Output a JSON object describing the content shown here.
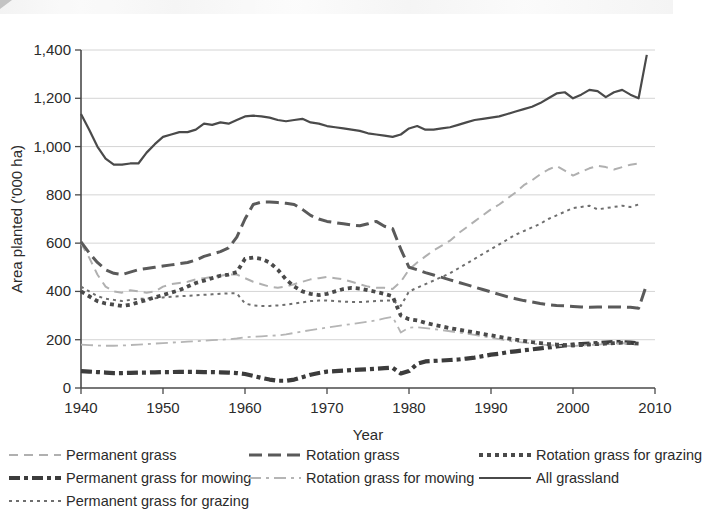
{
  "chart_data": {
    "type": "line",
    "title": "",
    "xlabel": "Year",
    "ylabel": "Area planted ('000 ha)",
    "xlim": [
      1940,
      2010
    ],
    "ylim": [
      0,
      1400
    ],
    "xticks": [
      "1940",
      "1950",
      "1960",
      "1970",
      "1980",
      "1990",
      "2000",
      "2010"
    ],
    "yticks": [
      "0",
      "200",
      "400",
      "600",
      "800",
      "1,000",
      "1,200",
      "1,400"
    ],
    "grid": true,
    "legend_position": "below",
    "series": [
      {
        "name": "Permanent grass",
        "style": "dashed-light",
        "color": "#b0b0b0",
        "x": [
          1940,
          1941,
          1942,
          1943,
          1944,
          1945,
          1946,
          1947,
          1948,
          1949,
          1950,
          1951,
          1952,
          1953,
          1954,
          1955,
          1956,
          1957,
          1958,
          1959,
          1960,
          1961,
          1962,
          1963,
          1964,
          1965,
          1966,
          1967,
          1968,
          1969,
          1970,
          1971,
          1972,
          1973,
          1974,
          1975,
          1976,
          1977,
          1978,
          1979,
          1980,
          1981,
          1982,
          1983,
          1984,
          1985,
          1986,
          1987,
          1988,
          1989,
          1990,
          1991,
          1992,
          1993,
          1994,
          1995,
          1996,
          1997,
          1998,
          1999,
          2000,
          2001,
          2002,
          2003,
          2004,
          2005,
          2006,
          2007,
          2008
        ],
        "y": [
          600,
          540,
          470,
          420,
          400,
          395,
          405,
          400,
          395,
          400,
          420,
          430,
          435,
          440,
          450,
          455,
          460,
          465,
          470,
          470,
          455,
          440,
          430,
          420,
          415,
          420,
          430,
          440,
          450,
          455,
          460,
          455,
          450,
          440,
          430,
          420,
          415,
          415,
          410,
          440,
          490,
          520,
          545,
          570,
          590,
          610,
          640,
          665,
          690,
          715,
          740,
          760,
          785,
          810,
          840,
          860,
          885,
          905,
          920,
          900,
          880,
          895,
          910,
          920,
          915,
          905,
          915,
          925,
          930
        ]
      },
      {
        "name": "Permanent grass for mowing",
        "style": "dashdot-heavy",
        "color": "#3c3c3c",
        "x": [
          1940,
          1941,
          1942,
          1943,
          1944,
          1945,
          1946,
          1947,
          1948,
          1949,
          1950,
          1951,
          1952,
          1953,
          1954,
          1955,
          1956,
          1957,
          1958,
          1959,
          1960,
          1961,
          1962,
          1963,
          1964,
          1965,
          1966,
          1967,
          1968,
          1969,
          1970,
          1971,
          1972,
          1973,
          1974,
          1975,
          1976,
          1977,
          1978,
          1979,
          1980,
          1981,
          1982,
          1983,
          1984,
          1985,
          1986,
          1987,
          1988,
          1989,
          1990,
          1991,
          1992,
          1993,
          1994,
          1995,
          1996,
          1997,
          1998,
          1999,
          2000,
          2001,
          2002,
          2003,
          2004,
          2005,
          2006,
          2007,
          2008
        ],
        "y": [
          70,
          68,
          66,
          64,
          62,
          62,
          63,
          64,
          64,
          65,
          66,
          66,
          67,
          67,
          67,
          66,
          66,
          65,
          64,
          62,
          58,
          50,
          42,
          35,
          30,
          30,
          35,
          45,
          55,
          62,
          68,
          70,
          72,
          74,
          76,
          78,
          80,
          82,
          84,
          60,
          70,
          100,
          110,
          112,
          114,
          116,
          118,
          122,
          126,
          132,
          138,
          142,
          148,
          152,
          156,
          160,
          164,
          168,
          172,
          176,
          180,
          182,
          184,
          186,
          188,
          190,
          190,
          188,
          185
        ]
      },
      {
        "name": "Permanent grass for grazing",
        "style": "dotted-fine",
        "color": "#6e6e6e",
        "x": [
          1940,
          1941,
          1942,
          1943,
          1944,
          1945,
          1946,
          1947,
          1948,
          1949,
          1950,
          1951,
          1952,
          1953,
          1954,
          1955,
          1956,
          1957,
          1958,
          1959,
          1960,
          1961,
          1962,
          1963,
          1964,
          1965,
          1966,
          1967,
          1968,
          1969,
          1970,
          1971,
          1972,
          1973,
          1974,
          1975,
          1976,
          1977,
          1978,
          1979,
          1980,
          1981,
          1982,
          1983,
          1984,
          1985,
          1986,
          1987,
          1988,
          1989,
          1990,
          1991,
          1992,
          1993,
          1994,
          1995,
          1996,
          1997,
          1998,
          1999,
          2000,
          2001,
          2002,
          2003,
          2004,
          2005,
          2006,
          2007,
          2008
        ],
        "y": [
          420,
          400,
          380,
          370,
          365,
          360,
          365,
          370,
          370,
          372,
          375,
          378,
          380,
          382,
          384,
          386,
          388,
          390,
          392,
          392,
          350,
          342,
          340,
          340,
          342,
          345,
          350,
          355,
          360,
          362,
          362,
          360,
          358,
          356,
          356,
          358,
          360,
          362,
          362,
          340,
          400,
          415,
          430,
          445,
          460,
          475,
          495,
          515,
          535,
          555,
          575,
          595,
          615,
          635,
          650,
          665,
          680,
          700,
          715,
          730,
          745,
          750,
          755,
          740,
          745,
          750,
          755,
          750,
          760
        ]
      },
      {
        "name": "Rotation grass",
        "style": "dashed-long-dark",
        "color": "#5a5a5a",
        "x": [
          1940,
          1941,
          1942,
          1943,
          1944,
          1945,
          1946,
          1947,
          1948,
          1949,
          1950,
          1951,
          1952,
          1953,
          1954,
          1955,
          1956,
          1957,
          1958,
          1959,
          1960,
          1961,
          1962,
          1963,
          1964,
          1965,
          1966,
          1967,
          1968,
          1969,
          1970,
          1971,
          1972,
          1973,
          1974,
          1975,
          1976,
          1977,
          1978,
          1979,
          1980,
          1981,
          1982,
          1983,
          1984,
          1985,
          1986,
          1987,
          1988,
          1989,
          1990,
          1991,
          1992,
          1993,
          1994,
          1995,
          1996,
          1997,
          1998,
          1999,
          2000,
          2001,
          2002,
          2003,
          2004,
          2005,
          2006,
          2007,
          2008,
          2009
        ],
        "y": [
          605,
          560,
          520,
          490,
          475,
          470,
          480,
          490,
          495,
          500,
          505,
          510,
          515,
          520,
          530,
          545,
          555,
          565,
          580,
          625,
          700,
          760,
          770,
          770,
          768,
          765,
          760,
          740,
          715,
          700,
          690,
          685,
          680,
          675,
          672,
          680,
          690,
          670,
          660,
          575,
          500,
          490,
          478,
          468,
          458,
          448,
          438,
          428,
          418,
          408,
          398,
          388,
          378,
          370,
          362,
          356,
          350,
          345,
          342,
          340,
          338,
          336,
          334,
          335,
          336,
          336,
          335,
          334,
          330,
          430
        ]
      },
      {
        "name": "Rotation grass for mowing",
        "style": "dashdot-light",
        "color": "#b5b5b5",
        "x": [
          1940,
          1941,
          1942,
          1943,
          1944,
          1945,
          1946,
          1947,
          1948,
          1949,
          1950,
          1951,
          1952,
          1953,
          1954,
          1955,
          1956,
          1957,
          1958,
          1959,
          1960,
          1961,
          1962,
          1963,
          1964,
          1965,
          1966,
          1967,
          1968,
          1969,
          1970,
          1971,
          1972,
          1973,
          1974,
          1975,
          1976,
          1977,
          1978,
          1979,
          1980,
          1981,
          1982,
          1983,
          1984,
          1985,
          1986,
          1987,
          1988,
          1989,
          1990,
          1991,
          1992,
          1993,
          1994,
          1995,
          1996,
          1997,
          1998,
          1999,
          2000,
          2001,
          2002,
          2003,
          2004,
          2005,
          2006,
          2007,
          2008
        ],
        "y": [
          180,
          178,
          176,
          175,
          175,
          176,
          178,
          180,
          182,
          184,
          186,
          188,
          190,
          192,
          194,
          196,
          198,
          200,
          202,
          205,
          210,
          212,
          214,
          216,
          218,
          222,
          228,
          234,
          240,
          245,
          250,
          255,
          260,
          265,
          270,
          275,
          280,
          288,
          295,
          230,
          250,
          252,
          248,
          244,
          240,
          235,
          230,
          225,
          220,
          214,
          208,
          202,
          196,
          192,
          188,
          184,
          180,
          178,
          176,
          174,
          174,
          176,
          178,
          180,
          182,
          184,
          186,
          184,
          182
        ]
      },
      {
        "name": "Rotation grass for grazing",
        "style": "dotted-thick",
        "color": "#4a4a4a",
        "x": [
          1940,
          1941,
          1942,
          1943,
          1944,
          1945,
          1946,
          1947,
          1948,
          1949,
          1950,
          1951,
          1952,
          1953,
          1954,
          1955,
          1956,
          1957,
          1958,
          1959,
          1960,
          1961,
          1962,
          1963,
          1964,
          1965,
          1966,
          1967,
          1968,
          1969,
          1970,
          1971,
          1972,
          1973,
          1974,
          1975,
          1976,
          1977,
          1978,
          1979,
          1980,
          1981,
          1982,
          1983,
          1984,
          1985,
          1986,
          1987,
          1988,
          1989,
          1990,
          1991,
          1992,
          1993,
          1994,
          1995,
          1996,
          1997,
          1998,
          1999,
          2000,
          2001,
          2002,
          2003,
          2004,
          2005,
          2006,
          2007,
          2008
        ],
        "y": [
          400,
          380,
          360,
          350,
          345,
          340,
          345,
          355,
          365,
          375,
          385,
          395,
          405,
          420,
          435,
          445,
          455,
          465,
          470,
          480,
          535,
          540,
          535,
          520,
          490,
          450,
          420,
          400,
          390,
          385,
          390,
          400,
          410,
          415,
          412,
          405,
          398,
          390,
          380,
          300,
          285,
          280,
          270,
          262,
          255,
          248,
          242,
          236,
          230,
          224,
          218,
          212,
          206,
          200,
          195,
          190,
          186,
          182,
          180,
          178,
          176,
          178,
          180,
          182,
          184,
          186,
          188,
          186,
          184
        ]
      },
      {
        "name": "All grassland",
        "style": "solid-dark",
        "color": "#4a4a4a",
        "x": [
          1940,
          1941,
          1942,
          1943,
          1944,
          1945,
          1946,
          1947,
          1948,
          1949,
          1950,
          1951,
          1952,
          1953,
          1954,
          1955,
          1956,
          1957,
          1958,
          1959,
          1960,
          1961,
          1962,
          1963,
          1964,
          1965,
          1966,
          1967,
          1968,
          1969,
          1970,
          1971,
          1972,
          1973,
          1974,
          1975,
          1976,
          1977,
          1978,
          1979,
          1980,
          1981,
          1982,
          1983,
          1984,
          1985,
          1986,
          1987,
          1988,
          1989,
          1990,
          1991,
          1992,
          1993,
          1994,
          1995,
          1996,
          1997,
          1998,
          1999,
          2000,
          2001,
          2002,
          2003,
          2004,
          2005,
          2006,
          2007,
          2008,
          2009
        ],
        "y": [
          1135,
          1070,
          1000,
          950,
          925,
          925,
          930,
          930,
          975,
          1010,
          1040,
          1050,
          1060,
          1060,
          1070,
          1095,
          1090,
          1100,
          1095,
          1110,
          1125,
          1128,
          1125,
          1120,
          1110,
          1105,
          1110,
          1115,
          1100,
          1095,
          1085,
          1080,
          1075,
          1070,
          1065,
          1055,
          1050,
          1045,
          1040,
          1050,
          1075,
          1085,
          1070,
          1070,
          1075,
          1080,
          1090,
          1100,
          1110,
          1115,
          1120,
          1125,
          1135,
          1145,
          1155,
          1165,
          1180,
          1200,
          1220,
          1225,
          1200,
          1215,
          1235,
          1230,
          1205,
          1225,
          1235,
          1215,
          1200,
          1380
        ]
      }
    ]
  },
  "legend": {
    "items": [
      {
        "label": "Permanent grass",
        "style": "dashed-light",
        "color": "#b0b0b0"
      },
      {
        "label": "Rotation grass",
        "style": "dashed-long-dark",
        "color": "#5a5a5a"
      },
      {
        "label": "Rotation grass for grazing",
        "style": "dotted-thick",
        "color": "#4a4a4a"
      },
      {
        "label": "Permanent grass for mowing",
        "style": "dashdot-heavy",
        "color": "#3c3c3c"
      },
      {
        "label": "Rotation grass for mowing",
        "style": "dashdot-light",
        "color": "#b5b5b5"
      },
      {
        "label": "All grassland",
        "style": "solid-dark",
        "color": "#4a4a4a"
      },
      {
        "label": "Permanent grass for grazing",
        "style": "dotted-fine",
        "color": "#6e6e6e"
      }
    ]
  }
}
